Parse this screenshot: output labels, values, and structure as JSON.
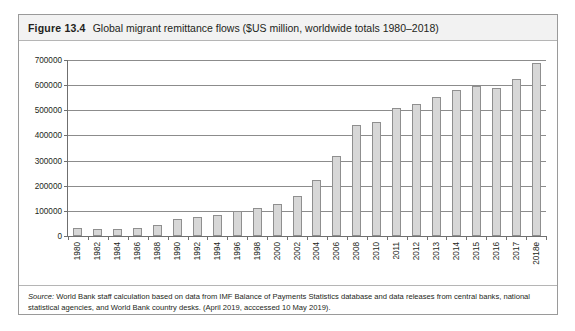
{
  "figure": {
    "number": "Figure 13.4",
    "caption": "Global migrant remittance flows ($US million, worldwide totals 1980–2018)",
    "source_label": "Source:",
    "source_text": " World Bank staff calculation based on data from IMF Balance of Payments Statistics database and data releases from central banks, national statistical agencies, and World Bank country desks. (April 2019, acccessed 10 May 2019)."
  },
  "colors": {
    "bar_fill": "#d7d7d7",
    "bar_stroke": "#8f8f8f",
    "gridline": "#8c8c8c",
    "axis": "#6f6f6f",
    "header_band": "#f2f2f2",
    "card_border": "#9a9a9a",
    "text": "#231f20"
  },
  "chart_data": {
    "type": "bar",
    "title": "Global migrant remittance flows ($US million, worldwide totals 1980–2018)",
    "xlabel": "",
    "ylabel": "",
    "ylim": [
      0,
      700000
    ],
    "ytick_step": 100000,
    "grid": true,
    "legend": "none",
    "ytick_labels": [
      "0",
      "100000",
      "200000",
      "300000",
      "400000",
      "500000",
      "600000",
      "700000"
    ],
    "ytick_values": [
      0,
      100000,
      200000,
      300000,
      400000,
      500000,
      600000,
      700000
    ],
    "categories": [
      "1980",
      "1982",
      "1984",
      "1986",
      "1988",
      "1990",
      "1992",
      "1994",
      "1996",
      "1998",
      "2000",
      "2002",
      "2004",
      "2006",
      "2008",
      "2010",
      "2011",
      "2012",
      "2013",
      "2014",
      "2015",
      "2016",
      "2017",
      "2018e"
    ],
    "values": [
      30000,
      26000,
      26000,
      31000,
      43000,
      68000,
      76000,
      82000,
      100000,
      112000,
      127000,
      160000,
      221000,
      319000,
      443000,
      453000,
      511000,
      527000,
      552000,
      580000,
      597000,
      589000,
      625000,
      689000
    ]
  }
}
